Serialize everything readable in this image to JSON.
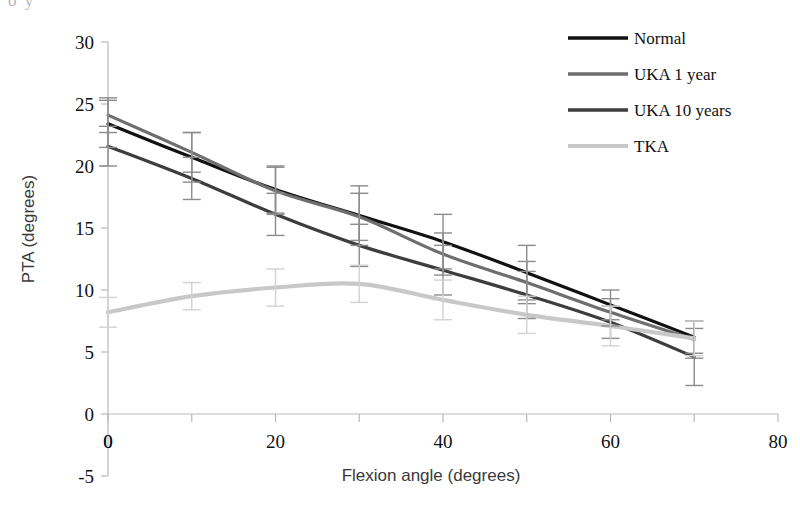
{
  "figure": {
    "top_fragment": "o   y",
    "background": "#ffffff"
  },
  "axes": {
    "x_title": "Flexion angle (degrees)",
    "y_title": "PTA (degrees)",
    "x_ticklabels": [
      "0",
      "20",
      "40",
      "60",
      "80"
    ],
    "y_ticklabels": [
      "30",
      "25",
      "20",
      "15",
      "10",
      "5",
      "0",
      "-5"
    ],
    "origin_label": "0"
  },
  "legend": {
    "items": [
      {
        "label": "Normal",
        "color": "#111111"
      },
      {
        "label": "UKA 1 year",
        "color": "#6e6e6e"
      },
      {
        "label": "UKA 10 years",
        "color": "#3d3d3d"
      },
      {
        "label": "TKA",
        "color": "#c8c8c8"
      }
    ]
  },
  "chart_data": {
    "type": "line",
    "title": "",
    "xlabel": "Flexion angle (degrees)",
    "ylabel": "PTA (degrees)",
    "xlim": [
      0,
      80
    ],
    "ylim": [
      -5,
      30
    ],
    "xticks": [
      0,
      10,
      20,
      30,
      40,
      50,
      60,
      70,
      80
    ],
    "xticklabels_at": [
      0,
      20,
      40,
      60,
      80
    ],
    "yticks": [
      -5,
      0,
      5,
      10,
      15,
      20,
      25,
      30
    ],
    "grid": false,
    "legend_position": "top-right",
    "errorbars": true,
    "x": [
      0,
      10,
      20,
      30,
      40,
      50,
      60,
      70
    ],
    "series": [
      {
        "name": "Normal",
        "color": "#111111",
        "values": [
          23.4,
          20.7,
          18.1,
          16.0,
          13.9,
          11.4,
          8.8,
          6.2
        ],
        "errors": [
          1.9,
          2.0,
          1.9,
          2.4,
          2.2,
          2.2,
          1.2,
          1.3
        ]
      },
      {
        "name": "UKA 1 year",
        "color": "#6e6e6e",
        "values": [
          24.1,
          21.1,
          18.0,
          15.9,
          12.9,
          10.6,
          8.2,
          6.0
        ],
        "errors": [
          1.4,
          1.6,
          1.9,
          1.9,
          1.7,
          1.7,
          1.1,
          1.5
        ]
      },
      {
        "name": "UKA 10 years",
        "color": "#3d3d3d",
        "values": [
          21.6,
          19.0,
          16.1,
          13.6,
          11.6,
          9.6,
          7.4,
          4.6
        ],
        "errors": [
          1.6,
          1.7,
          1.7,
          1.7,
          2.0,
          1.9,
          1.3,
          2.3
        ]
      },
      {
        "name": "TKA",
        "color": "#c8c8c8",
        "values": [
          8.2,
          9.5,
          10.2,
          10.5,
          9.2,
          8.0,
          7.1,
          6.1
        ],
        "errors": [
          1.2,
          1.1,
          1.5,
          1.5,
          1.6,
          1.5,
          1.6,
          1.4
        ]
      }
    ]
  }
}
